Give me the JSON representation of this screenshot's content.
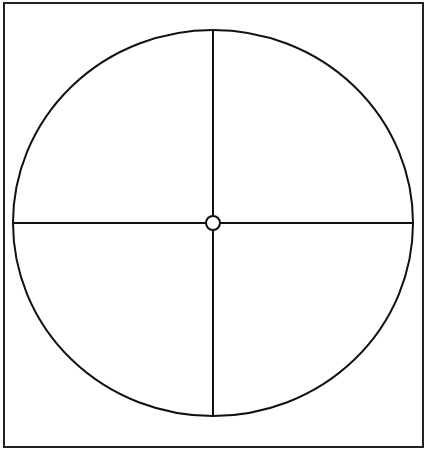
{
  "diagram": {
    "type": "circle-quadrants",
    "frame": {
      "x": 4,
      "y": 3,
      "width": 419,
      "height": 444,
      "stroke": "#222222"
    },
    "circle": {
      "cx": 213,
      "cy": 223,
      "rx": 200,
      "ry": 193,
      "stroke": "#111111"
    },
    "center_dot": {
      "cx": 213,
      "cy": 223,
      "r": 7,
      "fill": "#ffffff",
      "stroke": "#111111"
    },
    "divisions": 4,
    "background": "#ffffff"
  }
}
